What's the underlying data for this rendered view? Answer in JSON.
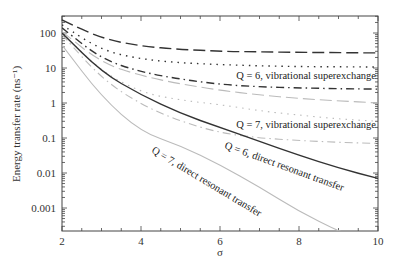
{
  "chart_data": {
    "type": "line",
    "title": "",
    "xlabel": "σ",
    "ylabel": "Energy transfer rate (ns⁻¹)",
    "xlim": [
      2,
      10
    ],
    "ylim": [
      0.0002,
      300
    ],
    "yscale": "log",
    "grid": false,
    "legend": "none (inline annotations)",
    "x_ticks": [
      "2",
      "4",
      "6",
      "8",
      "10"
    ],
    "y_ticks": [
      "0.001",
      "0.01",
      "0.1",
      "1",
      "10",
      "100"
    ],
    "x": [
      2,
      3,
      4,
      5,
      6,
      7,
      8,
      9,
      10
    ],
    "series": [
      {
        "name": "Q = 5, vibrational superexchange",
        "style": "long-dash",
        "color": "#333333",
        "values": [
          235,
          70,
          42,
          34,
          30,
          29,
          28,
          27.5,
          27
        ]
      },
      {
        "name": "Q = 6, vibrational superexchange (upper)",
        "style": "dotted",
        "color": "#333333",
        "values": [
          170,
          32,
          18,
          14,
          12.5,
          11.5,
          11,
          10.8,
          10.7
        ]
      },
      {
        "name": "Q = 6, vibrational superexchange",
        "style": "dash-dot",
        "color": "#333333",
        "values": [
          140,
          18,
          7.7,
          4.8,
          3.4,
          2.9,
          2.7,
          2.55,
          2.5
        ]
      },
      {
        "name": "Q = 7, vibrational superexchange (upper)",
        "style": "long-dash",
        "color": "#bbbbbb",
        "values": [
          110,
          14,
          6,
          3.5,
          2.3,
          1.7,
          1.35,
          1.15,
          1.0
        ]
      },
      {
        "name": "Q = 7, vibrational superexchange",
        "style": "dotted",
        "color": "#bbbbbb",
        "values": [
          100,
          8,
          2.0,
          1.2,
          0.9,
          0.6,
          0.45,
          0.35,
          0.3
        ]
      },
      {
        "name": "Q = 7, vibrational superexchange (lower)",
        "style": "dash-dot",
        "color": "#bbbbbb",
        "values": [
          90,
          5,
          0.9,
          0.3,
          0.14,
          0.1,
          0.085,
          0.075,
          0.07
        ]
      },
      {
        "name": "Q = 6, direct resonant transfer",
        "style": "solid",
        "color": "#333333",
        "values": [
          100,
          7.7,
          1.7,
          0.5,
          0.2,
          0.08,
          0.032,
          0.014,
          0.007
        ]
      },
      {
        "name": "Q = 7, direct resonant transfer",
        "style": "solid",
        "color": "#bbbbbb",
        "values": [
          45,
          1.5,
          0.15,
          0.06,
          0.017,
          0.004,
          0.0008,
          0.00022,
          null
        ]
      }
    ],
    "annotations": [
      "Q = 6, vibrational superexchange",
      "Q = 7, vibrational superexchange",
      "Q = 6, direct resonant transfer",
      "Q = 7, direct resonant transfer"
    ]
  },
  "labels": {
    "xlabel": "σ",
    "ylabel": "Energy transfer rate (ns⁻¹)",
    "annot_q6_vib": "Q = 6, vibrational superexchange",
    "annot_q7_vib": "Q = 7, vibrational superexchange",
    "annot_q6_direct": "Q = 6, direct resonant transfer",
    "annot_q7_direct": "Q = 7, direct resonant transfer"
  }
}
